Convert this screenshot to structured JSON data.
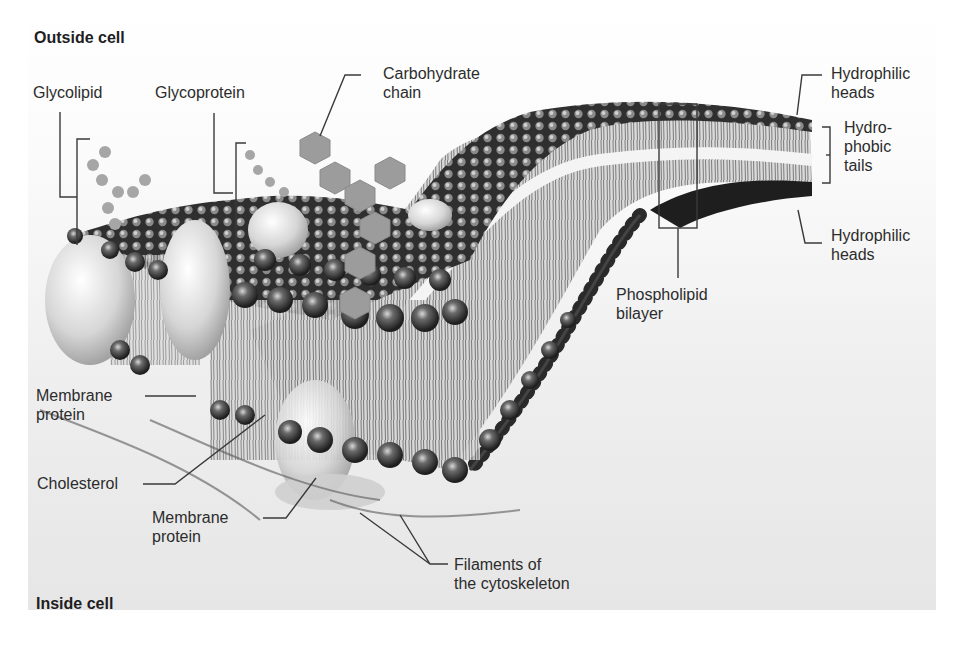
{
  "figure": {
    "regions": {
      "outside": "Outside cell",
      "inside": "Inside cell"
    },
    "labels": {
      "glycolipid": "Glycolipid",
      "glycoprotein": "Glycoprotein",
      "carbohydrate_chain": [
        "Carbohydrate",
        "chain"
      ],
      "hydrophilic_heads_top": [
        "Hydrophilic",
        "heads"
      ],
      "hydrophobic_tails": [
        "Hydro-",
        "phobic",
        "tails"
      ],
      "hydrophilic_heads_bottom": [
        "Hydrophilic",
        "heads"
      ],
      "phospholipid_bilayer": [
        "Phospholipid",
        "bilayer"
      ],
      "membrane_protein_left": [
        "Membrane",
        "protein"
      ],
      "cholesterol": "Cholesterol",
      "membrane_protein_bottom": [
        "Membrane",
        "protein"
      ],
      "filaments": [
        "Filaments of",
        "the cytoskeleton"
      ]
    },
    "colors": {
      "background_top": "#ffffff",
      "background_bottom": "#e6e6e6",
      "head_dark": "#2b2b2b",
      "head_highlight": "#bdbdbd",
      "tail": "#7a7a7a",
      "carbohydrate": "#9a9a9a",
      "text": "#2c2c2c"
    }
  }
}
